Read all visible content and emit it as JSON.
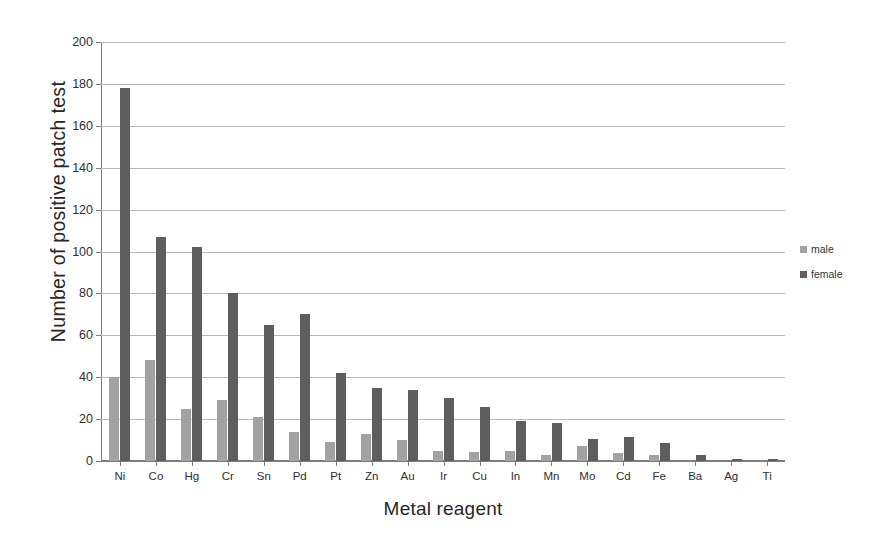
{
  "chart_data": {
    "type": "bar",
    "title": "",
    "xlabel": "Metal reagent",
    "ylabel": "Number of positive patch test",
    "categories": [
      "Ni",
      "Co",
      "Hg",
      "Cr",
      "Sn",
      "Pd",
      "Pt",
      "Zn",
      "Au",
      "Ir",
      "Cu",
      "In",
      "Mn",
      "Mo",
      "Cd",
      "Fe",
      "Ba",
      "Ag",
      "Ti"
    ],
    "series": [
      {
        "name": "male",
        "color": "#a2a2a2",
        "values": [
          40,
          48,
          25,
          29,
          21,
          14,
          9,
          13,
          10,
          5,
          4.5,
          5,
          3,
          7,
          4,
          3,
          0,
          0,
          0
        ]
      },
      {
        "name": "female",
        "color": "#5e5e5e",
        "values": [
          178,
          107,
          102,
          80,
          65,
          70,
          42,
          35,
          34,
          30,
          26,
          19,
          18,
          10.5,
          11.5,
          8.5,
          3,
          1,
          1
        ]
      }
    ],
    "ylim": [
      0,
      200
    ],
    "ytick_step": 20,
    "yticks": [
      0,
      20,
      40,
      60,
      80,
      100,
      120,
      140,
      160,
      180,
      200
    ],
    "ytick_labels": [
      "0",
      "20",
      "40",
      "60",
      "80",
      "100",
      "120",
      "140",
      "160",
      "180",
      "200"
    ],
    "grid": true,
    "legend_position": "right"
  },
  "legend": {
    "items": [
      {
        "label": "male",
        "color": "#a2a2a2"
      },
      {
        "label": "female",
        "color": "#5e5e5e"
      }
    ]
  }
}
